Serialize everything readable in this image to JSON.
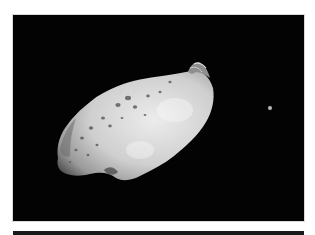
{
  "image": {
    "subject": "Asteroid with small moon in space",
    "alt": "Grayscale photograph of an elongated, cratered asteroid against a black background with a tiny moon to its right",
    "colors": {
      "background": "#ffffff",
      "space": "#030303",
      "asteroid_light": "#e6e6e6",
      "asteroid_mid": "#b4b4b4",
      "asteroid_shadow": "#5a5a5a",
      "moon": "#cfcfcf",
      "rule": "#1a1a1a"
    }
  }
}
